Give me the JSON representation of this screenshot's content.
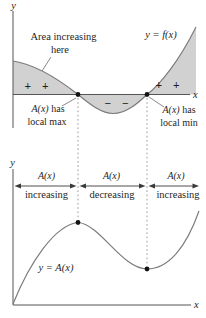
{
  "colors": {
    "region_fill": "#d1d1d1",
    "curve_stroke": "#7a7a7a",
    "axis_stroke": "#555555",
    "dotted_line": "#999999",
    "text": "#1f1f1f"
  },
  "top_graph": {
    "y_axis_label": "y",
    "x_axis_label": "x",
    "curve_label": "y = f(x)",
    "area_note_line1": "Area increasing",
    "area_note_line2": "here",
    "signs_left": "+ +",
    "signs_middle": "− −",
    "signs_right": "+ +",
    "max_note": {
      "math": "A(x)",
      "after": " has",
      "line2": "local max"
    },
    "min_note": {
      "math": "A(x)",
      "after": " has",
      "line2": "local min"
    }
  },
  "bottom_graph": {
    "y_axis_label": "y",
    "x_axis_label": "x",
    "curve_label": "y = A(x)",
    "intervals": [
      {
        "math": "A(x)",
        "word": "increasing"
      },
      {
        "math": "A(x)",
        "word": "decreasing"
      },
      {
        "math": "A(x)",
        "word": "increasing"
      }
    ]
  }
}
